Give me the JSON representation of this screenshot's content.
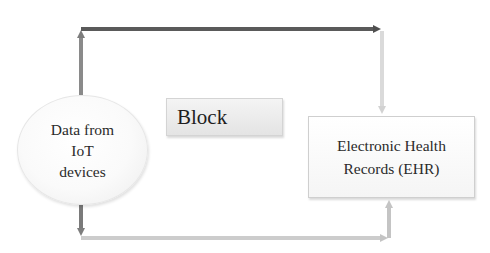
{
  "diagram": {
    "nodes": {
      "iot_source": {
        "shape": "ellipse",
        "lines": [
          "Data from",
          "IoT",
          "devices"
        ]
      },
      "block": {
        "shape": "rectangle",
        "label": "Block"
      },
      "ehr": {
        "shape": "rectangle",
        "lines": [
          "Electronic Health",
          "Records (EHR)"
        ]
      }
    },
    "edges": [
      {
        "id": "top-path",
        "from": "iot_source",
        "to": "ehr",
        "route": "up, right, down",
        "color": "#5a5a5a",
        "secondary_color": "#d9d9d9"
      },
      {
        "id": "bottom-path",
        "from": "iot_source",
        "to": "ehr",
        "route": "down, right, up",
        "color": "#7a7a7a",
        "secondary_color": "#c8c8c8"
      }
    ],
    "colors": {
      "dark_arrow": "#5a5a5a",
      "medium_arrow": "#8a8a8a",
      "light_arrow": "#cfcfcf",
      "node_border": "#d0d0d0",
      "block_fill": "#ececec"
    }
  }
}
